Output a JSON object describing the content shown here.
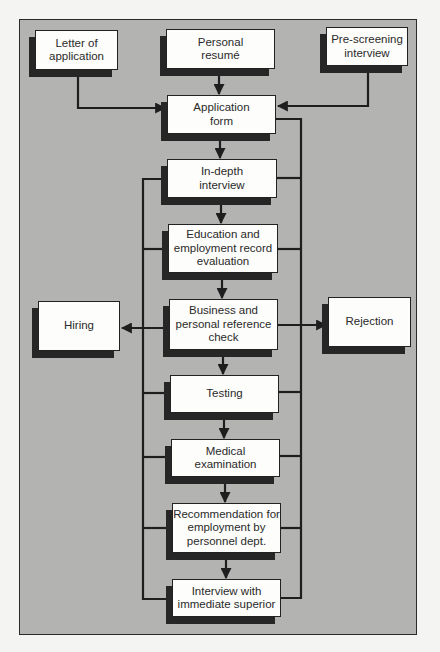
{
  "diagram": {
    "type": "flowchart",
    "colors": {
      "panel": "#b3b3b1",
      "box": "#fdfdfb",
      "line": "#1e1e1e",
      "shadow": "#262626"
    },
    "nodes": {
      "letter": "Letter of\napplication",
      "resume": "Personal\nresumé",
      "prescreen": "Pre-screening\ninterview",
      "appform": "Application\nform",
      "indepth": "In-depth\ninterview",
      "education": "Education and\nemployment record\nevaluation",
      "business": "Business and\npersonal reference\ncheck",
      "testing": "Testing",
      "medical": "Medical\nexamination",
      "recommend": "Recommendation for\nemployment by\npersonnel dept.",
      "superior": "Interview with\nimmediate superior",
      "hiring": "Hiring",
      "rejection": "Rejection"
    },
    "edges": [
      [
        "letter",
        "appform"
      ],
      [
        "resume",
        "appform"
      ],
      [
        "prescreen",
        "appform"
      ],
      [
        "appform",
        "indepth"
      ],
      [
        "indepth",
        "education"
      ],
      [
        "education",
        "business"
      ],
      [
        "business",
        "testing"
      ],
      [
        "testing",
        "medical"
      ],
      [
        "medical",
        "recommend"
      ],
      [
        "recommend",
        "superior"
      ],
      [
        "indepth..superior (left bus)",
        "hiring"
      ],
      [
        "appform..superior (right bus)",
        "rejection"
      ]
    ]
  }
}
